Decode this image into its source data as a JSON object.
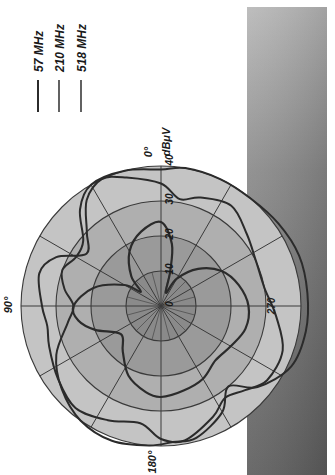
{
  "chart_data": {
    "type": "polar-line",
    "orientation_note": "figure printed rotated 90 degrees counter-clockwise; all text reads bottom-to-top",
    "title": "",
    "radial_axis": {
      "label": "dBμV",
      "ticks": [
        0,
        10,
        20,
        30,
        40
      ],
      "range": [
        0,
        40
      ]
    },
    "angular_axis": {
      "labels": [
        "0°",
        "90°",
        "180°",
        "270"
      ],
      "spoke_step_deg": 30
    },
    "legend": {
      "position": "top-left",
      "entries": [
        "57 MHz",
        "210 MHz",
        "518 MHz"
      ]
    },
    "series": [
      {
        "name": "57 MHz",
        "points": [
          [
            0,
            24
          ],
          [
            15,
            22
          ],
          [
            30,
            18
          ],
          [
            45,
            12
          ],
          [
            55,
            7
          ],
          [
            60,
            12
          ],
          [
            75,
            20
          ],
          [
            90,
            25
          ],
          [
            100,
            24
          ],
          [
            110,
            20
          ],
          [
            125,
            14
          ],
          [
            140,
            17
          ],
          [
            155,
            22
          ],
          [
            170,
            25
          ],
          [
            180,
            26
          ],
          [
            195,
            25
          ],
          [
            210,
            24
          ],
          [
            225,
            22
          ],
          [
            240,
            23
          ],
          [
            255,
            25
          ],
          [
            270,
            25
          ],
          [
            285,
            23
          ],
          [
            300,
            20
          ],
          [
            315,
            15
          ],
          [
            330,
            9
          ],
          [
            340,
            4
          ],
          [
            345,
            10
          ],
          [
            350,
            18
          ],
          [
            360,
            24
          ]
        ]
      },
      {
        "name": "210 MHz",
        "points": [
          [
            0,
            35
          ],
          [
            15,
            38
          ],
          [
            25,
            40
          ],
          [
            35,
            37
          ],
          [
            45,
            30
          ],
          [
            55,
            26
          ],
          [
            65,
            33
          ],
          [
            75,
            36
          ],
          [
            90,
            34
          ],
          [
            100,
            33
          ],
          [
            110,
            34
          ],
          [
            125,
            36
          ],
          [
            140,
            38
          ],
          [
            155,
            36
          ],
          [
            170,
            34
          ],
          [
            180,
            38
          ],
          [
            190,
            39
          ],
          [
            205,
            35
          ],
          [
            215,
            32
          ],
          [
            225,
            34
          ],
          [
            235,
            37
          ],
          [
            250,
            37
          ],
          [
            265,
            33
          ],
          [
            280,
            30
          ],
          [
            295,
            30
          ],
          [
            310,
            32
          ],
          [
            325,
            35
          ],
          [
            340,
            33
          ],
          [
            350,
            31
          ],
          [
            360,
            35
          ]
        ]
      },
      {
        "name": "518 MHz",
        "points": [
          [
            0,
            39
          ],
          [
            15,
            40
          ],
          [
            30,
            40
          ],
          [
            40,
            36
          ],
          [
            50,
            29
          ],
          [
            60,
            28
          ],
          [
            70,
            30
          ],
          [
            80,
            28
          ],
          [
            90,
            25
          ],
          [
            100,
            27
          ],
          [
            115,
            33
          ],
          [
            130,
            37
          ],
          [
            145,
            40
          ],
          [
            160,
            41
          ],
          [
            175,
            40
          ],
          [
            185,
            39
          ],
          [
            195,
            39
          ],
          [
            210,
            35
          ],
          [
            220,
            30
          ],
          [
            230,
            36
          ],
          [
            245,
            41
          ],
          [
            260,
            42
          ],
          [
            275,
            42
          ],
          [
            290,
            42
          ],
          [
            305,
            41
          ],
          [
            320,
            40
          ],
          [
            335,
            40
          ],
          [
            350,
            40
          ],
          [
            360,
            39
          ]
        ]
      }
    ]
  },
  "labels": {
    "deg0": "0°",
    "deg90": "90°",
    "deg180": "180°",
    "deg270": "270",
    "unit": "dBμV",
    "ticks": [
      "0",
      "10",
      "20",
      "30",
      "40"
    ]
  },
  "legend": {
    "items": [
      {
        "label": "57 MHz"
      },
      {
        "label": "210 MHz"
      },
      {
        "label": "518 MHz"
      }
    ]
  },
  "colors": {
    "background": "#ffffff",
    "panel_dark": "#6e6e6e",
    "panel_light": "#bdbdbd",
    "disk_outer": "#c4c4c4",
    "disk_mid": "#afafaf",
    "disk_inner": "#9a9a9a",
    "disk_core": "#8a8a8a",
    "curve": "#2b2b2b",
    "grid": "#3a3a3a"
  }
}
